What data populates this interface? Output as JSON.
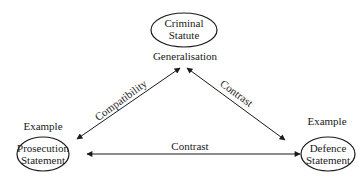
{
  "diagram": {
    "nodes": {
      "top": {
        "line1": "Criminal",
        "line2": "Statute"
      },
      "left": {
        "line1": "Prosecution",
        "line2": "Statement"
      },
      "right": {
        "line1": "Defence",
        "line2": "Statement"
      }
    },
    "labels": {
      "generalisation": "Generalisation",
      "example_left": "Example",
      "example_right": "Example"
    },
    "edges": {
      "left_top": "Compatibility",
      "top_right": "Contrast",
      "left_right": "Contrast"
    },
    "colors": {
      "stroke": "#1a1a1a",
      "background": "#ffffff"
    }
  }
}
